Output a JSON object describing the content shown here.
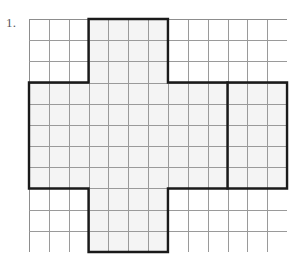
{
  "page": {
    "background_color": "#ffffff",
    "width": 302,
    "height": 259
  },
  "problem": {
    "number_label": "1.",
    "label_color": "#55585c"
  },
  "grid": {
    "origin_x": 29,
    "origin_y": 19,
    "columns": 13,
    "rows": 11,
    "cell_width": 19.85,
    "cell_height": 21.18,
    "line_color": "#9a9a9a",
    "cell_fill_color": "#f4f4f4",
    "bold_color": "#1a1a1a",
    "bold_stroke_width": 2.4
  },
  "figure": {
    "name": "net-of-rectangular-prism",
    "shaded_fill": "#f4f4f4",
    "regions": [
      {
        "name": "vertical-strip",
        "col_start": 3,
        "col_end": 7,
        "row_start": 0,
        "row_end": 11,
        "width_cells": 4,
        "height_cells": 11
      },
      {
        "name": "horizontal-band",
        "col_start": 0,
        "col_end": 13,
        "row_start": 3,
        "row_end": 8,
        "width_cells": 13,
        "height_cells": 5
      }
    ],
    "interior_bold_dividers": [
      {
        "name": "right-face-divider",
        "orientation": "vertical",
        "col": 10,
        "row_start": 3,
        "row_end": 8
      }
    ],
    "outline_path_cells": [
      [
        3,
        0
      ],
      [
        7,
        0
      ],
      [
        7,
        3
      ],
      [
        13,
        3
      ],
      [
        13,
        8
      ],
      [
        7,
        8
      ],
      [
        7,
        11
      ],
      [
        3,
        11
      ],
      [
        3,
        8
      ],
      [
        0,
        8
      ],
      [
        0,
        3
      ],
      [
        3,
        3
      ]
    ]
  }
}
